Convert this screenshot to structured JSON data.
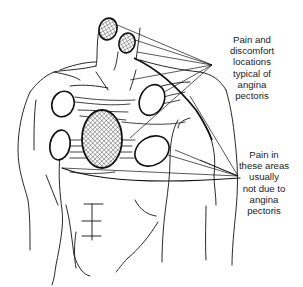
{
  "figure": {
    "colors": {
      "line": "#111111",
      "background": "#ffffff",
      "text": "#222222",
      "hatch": "#333333"
    }
  },
  "labels": {
    "typical": {
      "lines": [
        "Pain and",
        "discomfort",
        "locations",
        "typical of",
        "angina",
        "pectoris"
      ],
      "text": "Pain and\ndiscomfort\nlocations\ntypical of\nangina\npectoris"
    },
    "atypical": {
      "lines": [
        "Pain in",
        "these areas",
        "usually",
        "not due to",
        "angina",
        "pectoris"
      ],
      "text": "Pain in\nthese areas\nusually\nnot due to\nangina\npectoris"
    }
  },
  "regions": {
    "typical": [
      {
        "name": "jaw-left",
        "fill": "cross-hatch"
      },
      {
        "name": "jaw-right",
        "fill": "cross-hatch"
      },
      {
        "name": "central-chest",
        "fill": "cross-hatch"
      }
    ],
    "atypical": [
      {
        "name": "upper-left-chest",
        "fill": "none"
      },
      {
        "name": "upper-right-chest",
        "fill": "none"
      },
      {
        "name": "lower-left-chest",
        "fill": "none"
      },
      {
        "name": "lower-right-chest",
        "fill": "none"
      }
    ]
  }
}
